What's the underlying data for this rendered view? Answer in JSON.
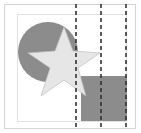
{
  "diagram": {
    "colors": {
      "circle": "#8c8c8c",
      "star": "#e6e6e6",
      "star_stroke": "#bdbdbd",
      "square": "#8c8c8c",
      "frame": "#d4d4d4",
      "dash": "#333333"
    },
    "shapes": [
      "circle",
      "star",
      "square"
    ],
    "guide_lines": 3
  }
}
